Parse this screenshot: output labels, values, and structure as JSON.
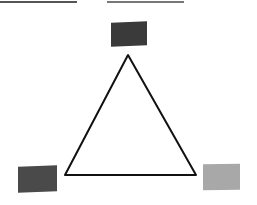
{
  "diagram": {
    "type": "color-triangle",
    "top_rules": [
      {
        "name": "left-rule",
        "x": 0,
        "width": 77,
        "color": "#555555"
      },
      {
        "name": "right-rule",
        "x": 107,
        "width": 77,
        "color": "#777777"
      }
    ],
    "swatches": [
      {
        "position": "top",
        "color": "#3a3a3a"
      },
      {
        "position": "bottom-left",
        "color": "#4a4a4a"
      },
      {
        "position": "bottom-right",
        "color": "#a8a8a8"
      }
    ],
    "triangle": {
      "stroke": "#111111",
      "vertices": [
        [
          128,
          55
        ],
        [
          65,
          175
        ],
        [
          196,
          175
        ]
      ]
    }
  }
}
